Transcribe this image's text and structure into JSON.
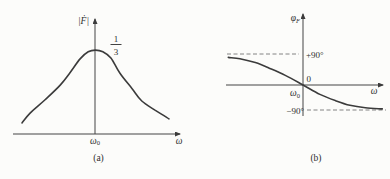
{
  "figure": {
    "line_color": "#3b3b3b",
    "axis_color": "#444444",
    "dash_color": "#767676",
    "background": "#fcfcfa"
  },
  "plot_a": {
    "caption": "(a)",
    "y_axis_label": "|Ḟ|",
    "x_axis_label": "ω",
    "origin_tick": {
      "base": "ω",
      "sub": "0"
    },
    "peak_fraction": {
      "num": "1",
      "den": "3"
    }
  },
  "plot_b": {
    "caption": "(b)",
    "y_axis_label": {
      "base": "φ",
      "sub": "F"
    },
    "x_axis_label": "ω",
    "origin_tick": {
      "base": "ω",
      "sub": "0"
    },
    "upper_asymptote_label": "+90°",
    "zero_label": "0",
    "lower_asymptote_label": "−90°"
  },
  "chart_data": [
    {
      "id": "a",
      "type": "line",
      "title": "(a)",
      "ylabel": "|Ḟ|",
      "xlabel": "ω",
      "x_units": "ω/ω₀",
      "x_tick_labels": [
        "ω₀"
      ],
      "peak": {
        "x": 1.0,
        "value_label": "1/3",
        "value": 0.333
      },
      "grid": false,
      "series": [
        {
          "name": "|Ḟ|(ω) resonance magnitude",
          "x": [
            0,
            0.11,
            0.31,
            0.52,
            0.65,
            0.79,
            0.9,
            1.0,
            1.1,
            1.21,
            1.33,
            1.5,
            1.63,
            1.81,
            2.0
          ],
          "y": [
            0.044,
            0.083,
            0.135,
            0.194,
            0.242,
            0.298,
            0.326,
            0.333,
            0.326,
            0.302,
            0.242,
            0.179,
            0.131,
            0.095,
            0.06
          ]
        }
      ]
    },
    {
      "id": "b",
      "type": "line",
      "title": "(b)",
      "ylabel": "φF",
      "xlabel": "ω",
      "x_units": "ω/ω₀",
      "x_tick_labels": [
        "ω₀"
      ],
      "y_ref_lines": [
        90,
        -90
      ],
      "y_ref_labels": [
        "+90°",
        "0",
        "−90°"
      ],
      "grid": false,
      "series": [
        {
          "name": "φF(ω) phase",
          "x": [
            0.03,
            0.18,
            0.38,
            0.57,
            0.77,
            1.0,
            1.22,
            1.42,
            1.61,
            1.81,
            2.03
          ],
          "y": [
            80,
            76,
            65,
            48,
            28,
            0,
            -34,
            -56,
            -73,
            -82,
            -86
          ]
        }
      ]
    }
  ]
}
